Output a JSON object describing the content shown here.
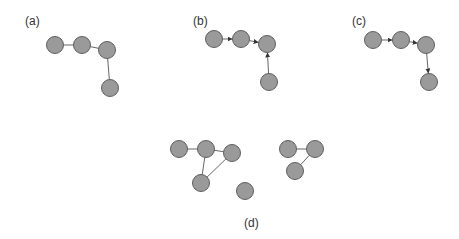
{
  "panels": [
    {
      "label": "(a)",
      "label_pos": [
        25,
        25
      ],
      "directed": false,
      "nodes": [
        [
          55,
          45
        ],
        [
          82,
          45
        ],
        [
          107,
          50
        ],
        [
          110,
          88
        ]
      ],
      "edges": [
        [
          0,
          1
        ],
        [
          1,
          2
        ],
        [
          2,
          3
        ]
      ]
    },
    {
      "label": "(b)",
      "label_pos": [
        193,
        25
      ],
      "directed": true,
      "nodes": [
        [
          214,
          39
        ],
        [
          241,
          39
        ],
        [
          267,
          44
        ],
        [
          269,
          82
        ]
      ],
      "edges": [
        [
          0,
          1
        ],
        [
          1,
          2
        ],
        [
          3,
          2
        ]
      ]
    },
    {
      "label": "(c)",
      "label_pos": [
        352,
        25
      ],
      "directed": true,
      "nodes": [
        [
          373,
          40
        ],
        [
          401,
          40
        ],
        [
          426,
          45
        ],
        [
          429,
          82
        ]
      ],
      "edges": [
        [
          0,
          1
        ],
        [
          1,
          2
        ],
        [
          2,
          3
        ]
      ]
    },
    {
      "label": "(d)",
      "label_pos": [
        244,
        227
      ],
      "directed": false,
      "nodes": [
        [
          179,
          149
        ],
        [
          206,
          149
        ],
        [
          232,
          153
        ],
        [
          201,
          183
        ],
        [
          245,
          191
        ],
        [
          288,
          149
        ],
        [
          315,
          149
        ],
        [
          295,
          171
        ]
      ],
      "edges": [
        [
          0,
          1
        ],
        [
          1,
          2
        ],
        [
          1,
          3
        ],
        [
          2,
          3
        ],
        [
          5,
          6
        ],
        [
          6,
          7
        ]
      ]
    }
  ],
  "style": {
    "node_fill": "#9a9a9a",
    "node_stroke": "#5f5f5f",
    "edge_color": "#666666",
    "node_radius": 8.5
  }
}
